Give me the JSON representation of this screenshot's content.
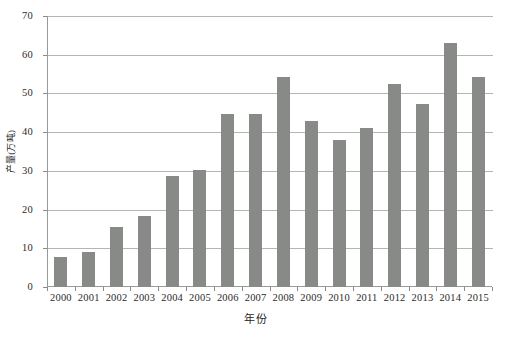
{
  "chart_data": {
    "type": "bar",
    "title": "",
    "subtitle": "",
    "xlabel": "年份",
    "ylabel": "产量(万吨)",
    "categories": [
      "2000",
      "2001",
      "2002",
      "2003",
      "2004",
      "2005",
      "2006",
      "2007",
      "2008",
      "2009",
      "2010",
      "2011",
      "2012",
      "2013",
      "2014",
      "2015"
    ],
    "values": [
      7.8,
      9.1,
      15.4,
      18.3,
      28.6,
      30.3,
      44.6,
      44.6,
      54.3,
      42.8,
      38.0,
      41.2,
      52.4,
      47.2,
      63.0,
      54.2
    ],
    "series": [
      {
        "name": "产量(万吨)",
        "values": [
          7.8,
          9.1,
          15.4,
          18.3,
          28.6,
          30.3,
          44.6,
          44.6,
          54.3,
          42.8,
          38.0,
          41.2,
          52.4,
          47.2,
          63.0,
          54.2
        ]
      }
    ],
    "ylim": [
      0,
      70
    ],
    "ytick_labels": [
      "0",
      "10",
      "20",
      "30",
      "40",
      "50",
      "60",
      "70"
    ],
    "ytick_values": [
      0,
      10,
      20,
      30,
      40,
      50,
      60,
      70
    ],
    "grid": "horizontal",
    "legend": "none",
    "bar_color": "#888a87",
    "gridline_color": "#b4b4b4",
    "axis_color": "#9a9a9a",
    "text_color": "#2b2b2b"
  }
}
